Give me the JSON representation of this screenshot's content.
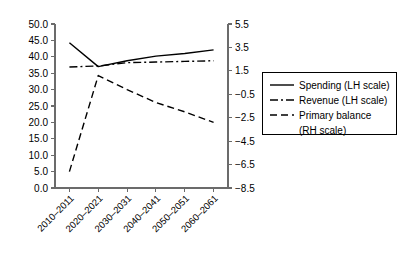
{
  "chart_data": {
    "type": "line",
    "title": "",
    "subtitle": "",
    "xlabel": "",
    "ylabel": "",
    "grid": false,
    "legend_position": "right",
    "categories": [
      "2010–2011",
      "2020–2021",
      "2030–2031",
      "2040–2041",
      "2050–2051",
      "2060–2061"
    ],
    "left_axis": {
      "label": "",
      "ylim": [
        0.0,
        50.0
      ],
      "ticks": [
        0.0,
        5.0,
        10.0,
        15.0,
        20.0,
        25.0,
        30.0,
        35.0,
        40.0,
        45.0,
        50.0
      ],
      "tick_labels": [
        "0.0",
        "5.0",
        "10.0",
        "15.0",
        "20.0",
        "25.0",
        "30.0",
        "35.0",
        "40.0",
        "45.0",
        "50.0"
      ]
    },
    "right_axis": {
      "label": "",
      "ylim": [
        -8.5,
        5.5
      ],
      "ticks": [
        -8.5,
        -6.5,
        -4.5,
        -2.5,
        -0.5,
        1.5,
        3.5,
        5.5
      ],
      "tick_labels": [
        "−8.5",
        "−6.5",
        "−4.5",
        "−2.5",
        "−0.5",
        "1.5",
        "3.5",
        "5.5"
      ]
    },
    "series": [
      {
        "name": "Spending (LH scale)",
        "axis": "left",
        "style": "solid",
        "color": "#000000",
        "values": [
          44.3,
          37.0,
          38.8,
          40.2,
          41.0,
          42.1
        ]
      },
      {
        "name": "Revenue (LH scale)",
        "axis": "left",
        "style": "dash-dot",
        "color": "#000000",
        "values": [
          36.9,
          37.2,
          38.2,
          38.4,
          38.6,
          38.8
        ]
      },
      {
        "name": "Primary balance (RH scale)",
        "axis": "right",
        "style": "dashed",
        "color": "#000000",
        "values": [
          -7.1,
          1.1,
          -0.1,
          -1.2,
          -2.0,
          -2.9
        ]
      }
    ]
  },
  "legend": {
    "entries": [
      {
        "label": "Spending (LH scale)",
        "style": "solid"
      },
      {
        "label": "Revenue (LH scale)",
        "style": "dash-dot"
      },
      {
        "label": "Primary balance",
        "style": "dashed"
      },
      {
        "label": "(RH scale)",
        "style": "none"
      }
    ]
  }
}
